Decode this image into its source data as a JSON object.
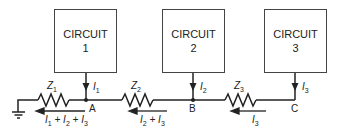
{
  "circuits": [
    {
      "title": "CIRCUIT",
      "number": "1",
      "current": "I",
      "current_sub": "1"
    },
    {
      "title": "CIRCUIT",
      "number": "2",
      "current": "I",
      "current_sub": "2"
    },
    {
      "title": "CIRCUIT",
      "number": "3",
      "current": "I",
      "current_sub": "3"
    }
  ],
  "impedances": [
    {
      "label": "Z",
      "sub": "1"
    },
    {
      "label": "Z",
      "sub": "2"
    },
    {
      "label": "Z",
      "sub": "3"
    }
  ],
  "nodes": [
    "A",
    "B",
    "C"
  ],
  "branch_currents": [
    "I1 + I2 + I3",
    "I2 + I3",
    "I3"
  ],
  "ground": "ground-symbol"
}
